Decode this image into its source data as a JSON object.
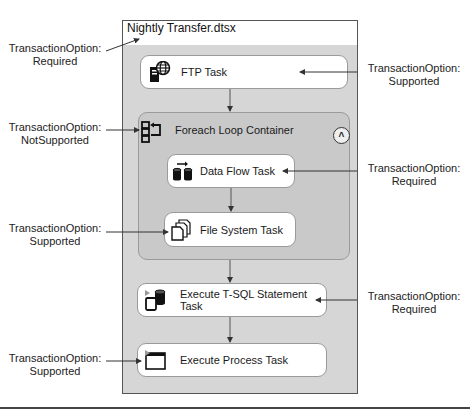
{
  "package": {
    "title": "Nightly Transfer.dtsx",
    "annotation": "TransactionOption:\nRequired",
    "annotation_lines": [
      "TransactionOption:",
      "Required"
    ]
  },
  "tasks": [
    {
      "id": "ftp",
      "label": "FTP Task",
      "icon": "ftp-globe-server-icon",
      "annotation_lines": [
        "TransactionOption:",
        "Supported"
      ]
    },
    {
      "id": "data-flow",
      "label": "Data Flow Task",
      "icon": "data-flow-cylinders-icon",
      "annotation_lines": [
        "TransactionOption:",
        "Required"
      ]
    },
    {
      "id": "file-system",
      "label": "File System Task",
      "icon": "file-stack-icon",
      "annotation_lines": [
        "TransactionOption:",
        "Supported"
      ]
    },
    {
      "id": "execute-sql",
      "label": "Execute T-SQL Statement Task",
      "icon": "sql-script-database-icon",
      "annotation_lines": [
        "TransactionOption:",
        "Required"
      ]
    },
    {
      "id": "execute-process",
      "label": "Execute Process Task",
      "icon": "process-window-icon",
      "annotation_lines": [
        "TransactionOption:",
        "Supported"
      ]
    }
  ],
  "container": {
    "label": "Foreach Loop Container",
    "icon": "foreach-loop-icon",
    "collapse_icon": "chevron-up-circle-icon",
    "collapse_glyph": "^",
    "annotation_lines": [
      "TransactionOption:",
      "NotSupported"
    ]
  },
  "colors": {
    "canvas": "#d6d6d6",
    "container": "#c9c9c9",
    "task_bg": "#ffffff",
    "border": "#9a9a9a",
    "line": "#333333"
  }
}
